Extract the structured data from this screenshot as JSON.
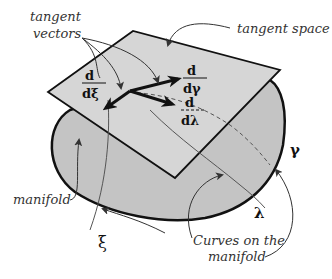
{
  "diagram": {
    "type": "tangent-space-illustration",
    "colors": {
      "manifold_fill": "#c4c4c4",
      "plane_fill": "#d6d6d6",
      "outline": "#111111",
      "annotation": "#333333",
      "vector": "#111111"
    },
    "labels": {
      "tangent_vectors_line1": "tangent",
      "tangent_vectors_line2": "vectors",
      "tangent_space": "tangent space",
      "manifold": "manifold",
      "curves_line1": "Curves on the",
      "curves_line2": "manifold"
    },
    "vectors": [
      {
        "name": "d-dxi",
        "numerator": "d",
        "denominator": "dξ"
      },
      {
        "name": "d-dgamma",
        "numerator": "d",
        "denominator": "dγ"
      },
      {
        "name": "d-dlambda",
        "numerator": "d",
        "denominator": "dλ"
      }
    ],
    "curves": [
      {
        "name": "xi",
        "symbol": "ξ"
      },
      {
        "name": "gamma",
        "symbol": "γ"
      },
      {
        "name": "lambda",
        "symbol": "λ"
      }
    ]
  }
}
